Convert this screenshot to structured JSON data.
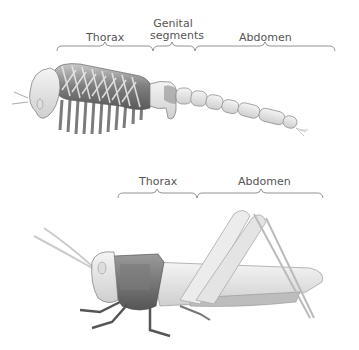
{
  "top_figure": {
    "labels": {
      "thorax": "Thorax",
      "genital_line1": "Genital",
      "genital_line2": "segments",
      "abdomen": "Abdomen"
    }
  },
  "bottom_figure": {
    "labels": {
      "thorax": "Thorax",
      "abdomen": "Abdomen"
    }
  }
}
